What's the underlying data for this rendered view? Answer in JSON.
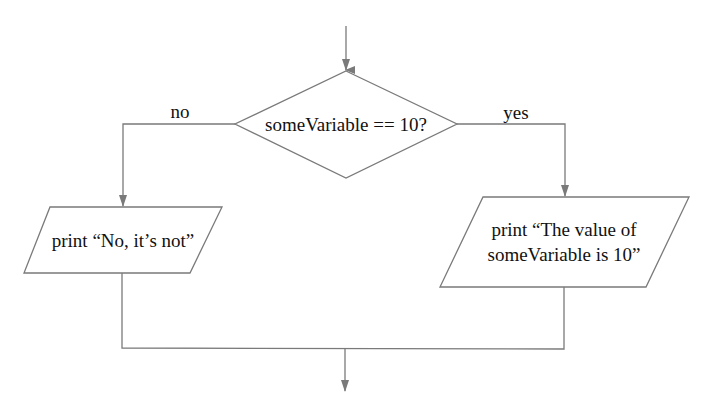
{
  "diagram": {
    "type": "flowchart",
    "line_color": "#7a7a7a",
    "text_color": "#111111",
    "decision": {
      "label": "someVariable == 10?"
    },
    "branches": {
      "no_label": "no",
      "yes_label": "yes"
    },
    "outputs": {
      "no_output": "print “No, it’s not”",
      "yes_output_line1": "print “The value of",
      "yes_output_line2": "someVariable is 10”"
    }
  }
}
